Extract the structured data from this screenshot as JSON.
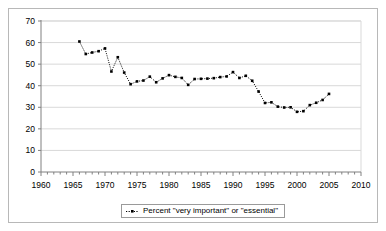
{
  "chart_data": {
    "type": "line",
    "title": "",
    "subtitle": "",
    "xlabel": "",
    "ylabel": "",
    "xlim": [
      1960,
      2010
    ],
    "ylim": [
      0,
      70
    ],
    "ytick_step": 10,
    "xtick_step": 5,
    "x_minor_tick_step": 1,
    "grid": true,
    "grid_axis": "y",
    "legend_position": "bottom-center",
    "marker": "square",
    "line_style": "dotted",
    "series_color": "#000000",
    "x_ticks": [
      1960,
      1965,
      1970,
      1975,
      1980,
      1985,
      1990,
      1995,
      2000,
      2005,
      2010
    ],
    "y_ticks": [
      0,
      10,
      20,
      30,
      40,
      50,
      60,
      70
    ],
    "series": [
      {
        "name": "Percent \"very important\" or \"essential\"",
        "x": [
          1966,
          1967,
          1968,
          1969,
          1970,
          1971,
          1972,
          1973,
          1974,
          1975,
          1976,
          1977,
          1978,
          1979,
          1980,
          1981,
          1982,
          1983,
          1984,
          1985,
          1986,
          1987,
          1988,
          1989,
          1990,
          1991,
          1992,
          1993,
          1994,
          1995,
          1996,
          1997,
          1998,
          1999,
          2000,
          2001,
          2002,
          2003,
          2004,
          2005
        ],
        "values": [
          60.5,
          54.7,
          55.4,
          56.0,
          57.3,
          46.6,
          53.2,
          46.1,
          40.7,
          42.0,
          42.4,
          44.2,
          41.6,
          43.4,
          44.9,
          44.1,
          43.6,
          40.4,
          43.1,
          43.2,
          43.3,
          43.5,
          44.0,
          44.3,
          46.3,
          43.6,
          44.6,
          42.3,
          37.3,
          32.0,
          32.3,
          30.3,
          29.9,
          30.0,
          27.9,
          28.2,
          31.0,
          32.1,
          33.4,
          36.2
        ]
      }
    ]
  },
  "legend": {
    "entries": [
      {
        "label": "Percent \"very important\" or \"essential\"",
        "marker": "dotted-line-marker",
        "color": "#000000"
      }
    ]
  },
  "axes": {
    "y_tick_labels": [
      "0",
      "10",
      "20",
      "30",
      "40",
      "50",
      "60",
      "70"
    ],
    "x_tick_labels": [
      "1960",
      "1965",
      "1970",
      "1975",
      "1980",
      "1985",
      "1990",
      "1995",
      "2000",
      "2005",
      "2010"
    ]
  }
}
